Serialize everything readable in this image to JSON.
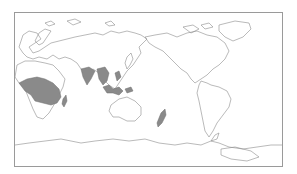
{
  "map": {
    "projection": "equirectangular, Pacific-centered",
    "center_longitude": 150,
    "background_color": "#ffffff",
    "coastline_color": "#8c8c8c",
    "frame_color": "#9a9a9a",
    "range_fill_color": "#8a8a8a",
    "shaded_regions": [
      "Sub-Saharan Africa",
      "Madagascar",
      "Indian subcontinent",
      "Southeast Asia mainland",
      "Indonesia / Philippines archipelago",
      "New Zealand"
    ],
    "landmasses": [
      "Europe",
      "Africa",
      "Asia",
      "Australia",
      "North America",
      "South America",
      "Greenland",
      "Antarctica"
    ]
  }
}
